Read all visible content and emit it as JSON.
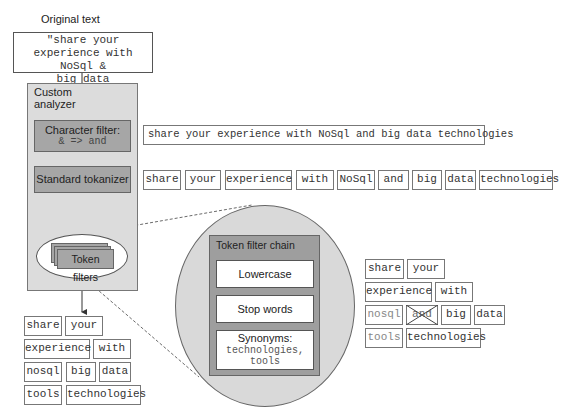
{
  "original": {
    "heading": "Original text",
    "lines": [
      "\"share your",
      "experience with NoSql &",
      "big data technologies\""
    ]
  },
  "analyzer": {
    "title_line1": "Custom",
    "title_line2": "analyzer",
    "char_filter": {
      "title": "Character filter:",
      "rule": "& => and"
    },
    "tokenizer": {
      "title": "Standard tokanizer"
    },
    "token_filters": {
      "title": "Token filters"
    }
  },
  "char_filter_output": "share your experience with NoSql and big data technologies",
  "tokenizer_output": [
    "share",
    "your",
    "experience",
    "with",
    "NoSql",
    "and",
    "big",
    "data",
    "technologies"
  ],
  "filter_chain": {
    "title": "Token filter chain",
    "steps": [
      {
        "title": "Lowercase"
      },
      {
        "title": "Stop words"
      },
      {
        "title": "Synonyms:",
        "detail_line1": "technologies,",
        "detail_line2": "tools"
      }
    ]
  },
  "filter_result": {
    "rows": [
      [
        {
          "text": "share"
        },
        {
          "text": "your"
        }
      ],
      [
        {
          "text": "experience"
        },
        {
          "text": "with"
        }
      ],
      [
        {
          "text": "nosql",
          "style": "faded"
        },
        {
          "text": "and",
          "style": "struck"
        },
        {
          "text": "big"
        },
        {
          "text": "data"
        }
      ],
      [
        {
          "text": "tools",
          "style": "faded"
        },
        {
          "text": "technologies"
        }
      ]
    ]
  },
  "final_output": {
    "rows": [
      [
        "share",
        "your"
      ],
      [
        "experience",
        "with"
      ],
      [
        "nosql",
        "big",
        "data"
      ],
      [
        "tools",
        "technologies"
      ]
    ]
  },
  "colors": {
    "analyzer_bg": "#dcdcdc",
    "stage_box": "#a6a6a6",
    "circle_bg": "#d9d9d9",
    "chain_bg": "#9e9e9e",
    "border": "#666666"
  }
}
